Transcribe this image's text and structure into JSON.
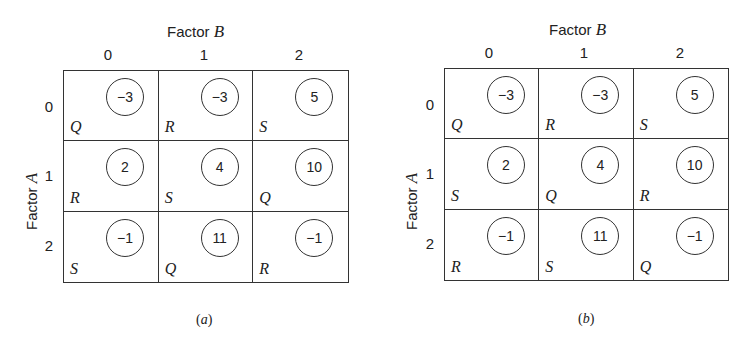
{
  "panels": [
    {
      "caption_open": "(",
      "caption_letter": "a",
      "caption_close": ")",
      "factor_b": {
        "prefix": "Factor ",
        "var": "B"
      },
      "factor_a": {
        "prefix": "Factor ",
        "var": "A"
      },
      "col_labels": [
        "0",
        "1",
        "2"
      ],
      "row_labels": [
        "0",
        "1",
        "2"
      ],
      "cells": [
        [
          {
            "value": "−3",
            "letter": "Q"
          },
          {
            "value": "−3",
            "letter": "R"
          },
          {
            "value": "5",
            "letter": "S"
          }
        ],
        [
          {
            "value": "2",
            "letter": "R"
          },
          {
            "value": "4",
            "letter": "S"
          },
          {
            "value": "10",
            "letter": "Q"
          }
        ],
        [
          {
            "value": "−1",
            "letter": "S"
          },
          {
            "value": "11",
            "letter": "Q"
          },
          {
            "value": "−1",
            "letter": "R"
          }
        ]
      ]
    },
    {
      "caption_open": "(",
      "caption_letter": "b",
      "caption_close": ")",
      "factor_b": {
        "prefix": "Factor ",
        "var": "B"
      },
      "factor_a": {
        "prefix": "Factor ",
        "var": "A"
      },
      "col_labels": [
        "0",
        "1",
        "2"
      ],
      "row_labels": [
        "0",
        "1",
        "2"
      ],
      "cells": [
        [
          {
            "value": "−3",
            "letter": "Q"
          },
          {
            "value": "−3",
            "letter": "R"
          },
          {
            "value": "5",
            "letter": "S"
          }
        ],
        [
          {
            "value": "2",
            "letter": "S"
          },
          {
            "value": "4",
            "letter": "Q"
          },
          {
            "value": "10",
            "letter": "R"
          }
        ],
        [
          {
            "value": "−1",
            "letter": "R"
          },
          {
            "value": "11",
            "letter": "S"
          },
          {
            "value": "−1",
            "letter": "Q"
          }
        ]
      ]
    }
  ]
}
